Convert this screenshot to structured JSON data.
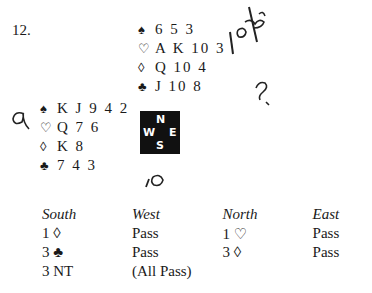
{
  "problem_number": "12.",
  "north": {
    "spades": "6 5 3",
    "hearts": "A K 10 3",
    "diamonds": "Q 10 4",
    "clubs": "J 10 8"
  },
  "west": {
    "spades": "K J 9 4 2",
    "hearts": "Q 7 6",
    "diamonds": "K 8",
    "clubs": "7 4 3"
  },
  "suits": {
    "spades": "♠",
    "hearts": "♡",
    "diamonds": "◊",
    "clubs": "♣"
  },
  "compass": {
    "n": "N",
    "w": "W",
    "e": "E",
    "s": "S"
  },
  "handwriting": {
    "top_right": "10 ♣",
    "question": "?",
    "left": "a",
    "bottom": "10"
  },
  "auction": {
    "headers": [
      "South",
      "West",
      "North",
      "East"
    ],
    "rows": [
      [
        "1 ◊",
        "Pass",
        "1 ♡",
        "Pass"
      ],
      [
        "3 ♣",
        "Pass",
        "3 ◊",
        "Pass"
      ],
      [
        "3 NT",
        "(All Pass)",
        "",
        ""
      ]
    ]
  }
}
